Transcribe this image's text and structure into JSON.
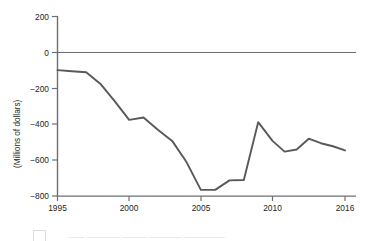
{
  "chart_data": {
    "type": "line",
    "title": "",
    "subtitle": "",
    "xlabel": "",
    "ylabel": "(Millions of dollars)",
    "x": [
      1995,
      1996,
      1997,
      1998,
      1999,
      2000,
      2001,
      2002,
      2003,
      2004,
      2005,
      2006,
      2007,
      2008,
      2009,
      2010,
      2011,
      2012,
      2013,
      2014,
      2015,
      2016
    ],
    "values": [
      -98,
      -104,
      -110,
      -175,
      -272,
      -375,
      -362,
      -430,
      -492,
      -610,
      -765,
      -765,
      -712,
      -710,
      -388,
      -492,
      -552,
      -540,
      -480,
      -505,
      -522,
      -545
    ],
    "series": [
      {
        "name": "net value",
        "values": [
          -98,
          -104,
          -110,
          -175,
          -272,
          -375,
          -362,
          -430,
          -492,
          -610,
          -765,
          -765,
          -712,
          -710,
          -388,
          -492,
          -552,
          -540,
          -480,
          -505,
          -522,
          -545
        ]
      }
    ],
    "xticks": [
      1995,
      2000,
      2005,
      2010,
      2016
    ],
    "xtick_labels": [
      "1995",
      "2000",
      "2005",
      "2010",
      "2016"
    ],
    "yticks": [
      200,
      0,
      -200,
      -400,
      -600,
      -800
    ],
    "ytick_labels": [
      "200",
      "0",
      "−200",
      "−400",
      "−600",
      "−800"
    ],
    "ylim": [
      -800,
      200
    ],
    "xlim": [
      1995,
      2016
    ],
    "grid": false,
    "zero_reference_line": true,
    "legend": "none",
    "line_color": "#58595b",
    "axis_color": "#6d6e71",
    "background": "#ffffff"
  },
  "axis": {
    "y_title": "(Millions of dollars)",
    "y_labels": [
      "200",
      "0",
      "−200",
      "−400",
      "−600",
      "−800"
    ],
    "x_labels": [
      "1995",
      "2000",
      "2005",
      "2010",
      "2016"
    ]
  },
  "footer": {
    "caption_fragment": "—— ———— ——— ———— —————"
  }
}
